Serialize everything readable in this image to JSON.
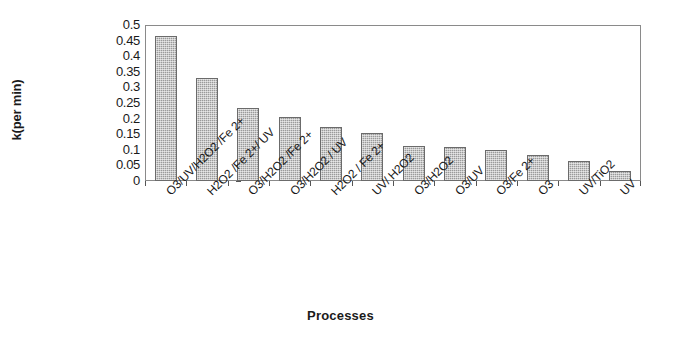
{
  "chart_data": {
    "type": "bar",
    "title": "",
    "xlabel": "Processes",
    "ylabel": "k(per min)",
    "ylim": [
      0,
      0.5
    ],
    "grid": false,
    "legend": null,
    "yticks": [
      "0.5",
      "0.45",
      "0.4",
      "0.35",
      "0.3",
      "0.25",
      "0.2",
      "0.15",
      "0.1",
      "0.05",
      "0"
    ],
    "ytick_values": [
      0.5,
      0.45,
      0.4,
      0.35,
      0.3,
      0.25,
      0.2,
      0.15,
      0.1,
      0.05,
      0
    ],
    "categories": [
      "O3/UV/H2O2 /Fe 2+",
      "H2O2 /Fe 2+/ UV",
      "O3/H2O2 /Fe 2+",
      "O3/H2O2 / UV",
      "H2O2 / Fe 2+",
      "UV/ H2O2",
      "O3/H2O2",
      "O3/UV",
      "O3/Fe 2+",
      "O3",
      "UV/TiO2",
      "UV"
    ],
    "values": [
      0.465,
      0.33,
      0.235,
      0.205,
      0.172,
      0.153,
      0.113,
      0.108,
      0.1,
      0.084,
      0.065,
      0.033
    ],
    "bar_color": "#9a9a9a",
    "bar_edge_color": "#6b6b6b",
    "axis_color": "#8a8a8a",
    "background_color": "#ffffff"
  }
}
